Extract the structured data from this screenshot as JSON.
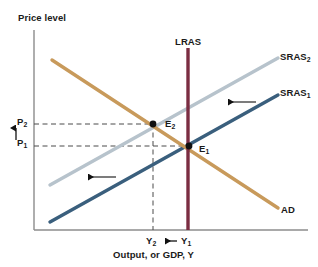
{
  "figure": {
    "type": "economics-as-ad-diagram",
    "background": "#ffffff"
  },
  "axes": {
    "y_title": "Price level",
    "x_title": "Output, or GDP, Y",
    "axis_color": "#8c8c8c",
    "origin_px": {
      "x": 34,
      "y": 230
    },
    "top_px": 30,
    "right_px": 308
  },
  "curves": {
    "ad": {
      "label": "AD",
      "color": "#c89a5b",
      "x1": 52,
      "y1": 60,
      "x2": 278,
      "y2": 208
    },
    "sras1": {
      "label": "SRAS",
      "sub": "1",
      "color": "#3a5f7d",
      "x1": 50,
      "y1": 222,
      "x2": 278,
      "y2": 95
    },
    "sras2": {
      "label": "SRAS",
      "sub": "2",
      "color": "#b7c3cc",
      "x1": 50,
      "y1": 185,
      "x2": 278,
      "y2": 58
    },
    "lras": {
      "label": "LRAS",
      "color": "#7b2d42",
      "x": 188,
      "y_top": 48,
      "y_bottom": 230
    }
  },
  "equilibria": [
    {
      "name": "E",
      "sub": "2",
      "x": 153,
      "y": 124,
      "dot_color": "#111111"
    },
    {
      "name": "E",
      "sub": "1",
      "x": 189,
      "y": 146,
      "dot_color": "#111111"
    }
  ],
  "price_levels": [
    {
      "name": "P",
      "sub": "2",
      "value_y": 124
    },
    {
      "name": "P",
      "sub": "1",
      "value_y": 146
    }
  ],
  "output_levels": [
    {
      "name": "Y",
      "sub": "2",
      "value_x": 153
    },
    {
      "name": "Y",
      "sub": "1",
      "value_x": 189
    }
  ],
  "annotations": {
    "price_up_arrow": {
      "direction": "up",
      "x": 16,
      "y_from": 140,
      "y_to": 127
    },
    "output_left_arrow": {
      "direction": "left",
      "y": 241,
      "x_from": 177,
      "x_to": 163
    },
    "sras_shift_arrow_upper": {
      "direction": "left",
      "y": 102,
      "x_from": 256,
      "x_to": 226
    },
    "sras_shift_arrow_lower": {
      "direction": "left",
      "y": 177,
      "x_from": 116,
      "x_to": 86
    },
    "arrow_color": "#111111",
    "guide_color": "#4a4a4a"
  },
  "labels": {
    "price_level": "Price level",
    "output_gdp": "Output, or GDP, Y",
    "lras": "LRAS",
    "ad": "AD",
    "sras_base": "SRAS",
    "e_base": "E",
    "p_base": "P",
    "y_base": "Y",
    "sub_one": "1",
    "sub_two": "2"
  }
}
